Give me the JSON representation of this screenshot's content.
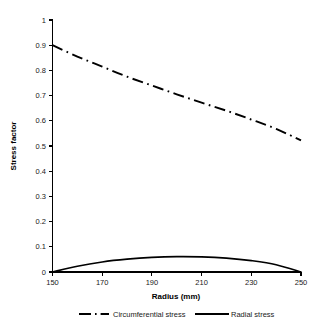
{
  "chart_data": {
    "type": "line",
    "title": "",
    "xlabel": "Radius (mm)",
    "ylabel": "Stress factor",
    "xlim": [
      150,
      250
    ],
    "ylim": [
      0,
      1
    ],
    "grid": false,
    "legend_position": "bottom",
    "xticks": [
      "150",
      "170",
      "190",
      "210",
      "230",
      "250"
    ],
    "xtick_values": [
      150,
      170,
      190,
      210,
      230,
      250
    ],
    "yticks": [
      "0",
      "0.1",
      "0.2",
      "0.3",
      "0.4",
      "0.5",
      "0.6",
      "0.7",
      "0.8",
      "0.9",
      "1"
    ],
    "ytick_values": [
      0,
      0.1,
      0.2,
      0.3,
      0.4,
      0.5,
      0.6,
      0.7,
      0.8,
      0.9,
      1
    ],
    "x": [
      150,
      160,
      170,
      180,
      190,
      200,
      210,
      220,
      230,
      240,
      250
    ],
    "series": [
      {
        "name": "Circumferential stress",
        "style": "dash-dot",
        "color": "#000000",
        "values": [
          0.9,
          0.855,
          0.815,
          0.775,
          0.74,
          0.705,
          0.672,
          0.64,
          0.605,
          0.568,
          0.522
        ]
      },
      {
        "name": "Radial stress",
        "style": "solid",
        "color": "#000000",
        "values": [
          0.0,
          0.023,
          0.04,
          0.051,
          0.058,
          0.061,
          0.06,
          0.055,
          0.045,
          0.029,
          0.0
        ]
      }
    ]
  },
  "legend": {
    "items": [
      {
        "label": "Circumferential stress",
        "style": "dash-dot"
      },
      {
        "label": "Radial stress",
        "style": "solid"
      }
    ]
  },
  "axes": {
    "x_title": "Radius (mm)",
    "y_title": "Stress factor"
  }
}
